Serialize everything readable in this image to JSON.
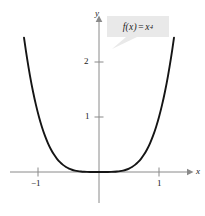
{
  "figure": {
    "name": "quartic-function-graph",
    "background_color": "#ffffff",
    "width": 205,
    "height": 216
  },
  "labels": {
    "x_axis_name": "x",
    "y_axis_name": "y",
    "x_tick_neg1": "−1",
    "x_tick_pos1": "1",
    "y_tick_1": "1",
    "y_tick_2": "2"
  },
  "callout": {
    "function_base": "f(x)",
    "equals": "=",
    "variable": "x",
    "exponent": "4",
    "full_text": "f(x) = x⁴",
    "background_color": "#e9e9e9",
    "text_color": "#1a1a1a"
  },
  "chart_data": {
    "type": "line",
    "title": "",
    "subtitle": "",
    "xlabel": "x",
    "ylabel": "y",
    "function": "f(x) = x^4",
    "expression": "x**4",
    "xlim": [
      -1.35,
      1.35
    ],
    "ylim": [
      -0.35,
      2.85
    ],
    "xticks": [
      -1,
      1
    ],
    "xticklabels": [
      "−1",
      "1"
    ],
    "yticks": [
      1,
      2
    ],
    "yticklabels": [
      "1",
      "2"
    ],
    "grid": false,
    "legend": false,
    "axis_color": "#8a8a8a",
    "curve_color": "#151515",
    "curve_width": 1.9,
    "annotations": [
      {
        "text": "f(x) = x⁴",
        "x": 0.85,
        "y": 2.55,
        "style": "gray-callout-box"
      }
    ],
    "x": [
      -1.3,
      -1.25,
      -1.2,
      -1.15,
      -1.1,
      -1.05,
      -1.0,
      -0.95,
      -0.9,
      -0.85,
      -0.8,
      -0.75,
      -0.7,
      -0.65,
      -0.6,
      -0.55,
      -0.5,
      -0.45,
      -0.4,
      -0.35,
      -0.3,
      -0.25,
      -0.2,
      -0.15,
      -0.1,
      -0.05,
      0.0,
      0.05,
      0.1,
      0.15,
      0.2,
      0.25,
      0.3,
      0.35,
      0.4,
      0.45,
      0.5,
      0.55,
      0.6,
      0.65,
      0.7,
      0.75,
      0.8,
      0.85,
      0.9,
      0.95,
      1.0,
      1.05,
      1.1,
      1.15,
      1.2,
      1.25,
      1.3
    ],
    "y": [
      2.8561,
      2.4414,
      2.0736,
      1.749,
      1.4641,
      1.2155,
      1.0,
      0.8145,
      0.6561,
      0.522,
      0.4096,
      0.3164,
      0.2401,
      0.1785,
      0.1296,
      0.0915,
      0.0625,
      0.041,
      0.0256,
      0.015,
      0.0081,
      0.0039,
      0.0016,
      0.0005,
      0.0001,
      0.0,
      0.0,
      0.0,
      0.0001,
      0.0005,
      0.0016,
      0.0039,
      0.0081,
      0.015,
      0.0256,
      0.041,
      0.0625,
      0.0915,
      0.1296,
      0.1785,
      0.2401,
      0.3164,
      0.4096,
      0.522,
      0.6561,
      0.8145,
      1.0,
      1.2155,
      1.4641,
      1.749,
      2.0736,
      2.4414,
      2.8561
    ]
  }
}
